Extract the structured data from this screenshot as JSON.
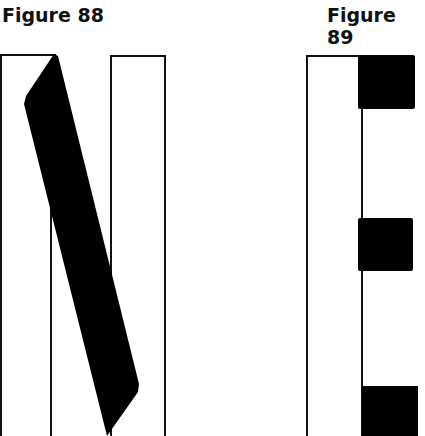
{
  "figures": [
    {
      "caption": "Figure 88",
      "description": "Letter N formed by two outlined vertical rectangles and a thick black diagonal stroke",
      "colors": {
        "stroke": "#111111",
        "fill": "#000000",
        "background": "#ffffff"
      }
    },
    {
      "caption": "Figure 89",
      "description": "Letter E formed by an outlined vertical rectangle and three black squares on the right",
      "colors": {
        "stroke": "#111111",
        "fill": "#000000",
        "background": "#ffffff"
      }
    }
  ]
}
